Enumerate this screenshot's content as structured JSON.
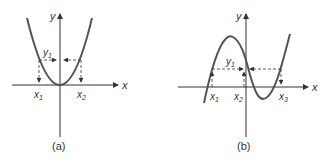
{
  "figure": {
    "panels": [
      {
        "id": "a",
        "caption": "(a)",
        "axis_x_label": "x",
        "axis_y_label": "y",
        "curve": "parabola",
        "level_label": "y",
        "level_sub": "1",
        "roots": [
          {
            "label": "x",
            "sub": "1"
          },
          {
            "label": "x",
            "sub": "2"
          }
        ]
      },
      {
        "id": "b",
        "caption": "(b)",
        "axis_x_label": "x",
        "axis_y_label": "y",
        "curve": "cubic",
        "level_label": "y",
        "level_sub": "1",
        "roots": [
          {
            "label": "x",
            "sub": "1"
          },
          {
            "label": "x",
            "sub": "2"
          },
          {
            "label": "x",
            "sub": "3"
          }
        ]
      }
    ],
    "colors": {
      "line": "#333333",
      "curve": "#555555",
      "background": "#ffffff"
    }
  }
}
